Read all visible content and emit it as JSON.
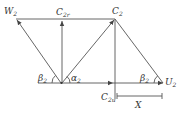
{
  "diagram": {
    "type": "velocity-triangle",
    "labels": {
      "W2": {
        "main": "W",
        "sub": "2"
      },
      "C2r": {
        "main": "C",
        "sub": "2r"
      },
      "C2": {
        "main": "C",
        "sub": "2"
      },
      "U2": {
        "main": "U",
        "sub": "2"
      },
      "C2u": {
        "main": "C",
        "sub": "2u"
      },
      "X": {
        "main": "X",
        "sub": ""
      },
      "beta2_left": {
        "main": "β",
        "sub": "2"
      },
      "alpha2": {
        "main": "α",
        "sub": "2"
      },
      "beta2_right": {
        "main": "β",
        "sub": "2"
      }
    },
    "colors": {
      "line": "#555555",
      "text": "#333333",
      "background": "#ffffff"
    }
  }
}
